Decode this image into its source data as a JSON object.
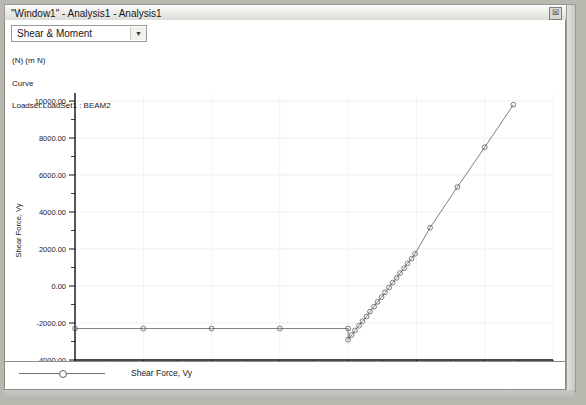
{
  "window": {
    "title": "\"Window1\" - Analysis1 - Analysis1",
    "close_icon": "close-icon",
    "close_glyph": "☒"
  },
  "toolbar": {
    "combo_value": "Shear & Moment",
    "combo_arrow_icon": "chevron-down-icon",
    "combo_arrow_glyph": "▼"
  },
  "header_info": {
    "line1": "(N) (m N)",
    "line2": "Curve",
    "line3": "Loadset:LoadSet1 : BEAM2"
  },
  "legend": {
    "entry_label": "Shear Force, Vy"
  },
  "chart_data": {
    "type": "line",
    "title": "",
    "xlabel": "Curve Arc Length (m)",
    "ylabel": "Shear Force, Vy",
    "xlim": [
      0,
      7
    ],
    "ylim": [
      -4000,
      10000
    ],
    "xticks": [
      0,
      1,
      2,
      3,
      4,
      5,
      6,
      7
    ],
    "xticklabels": [
      "0.00",
      "1.00",
      "2.00",
      "3.00",
      "4.00",
      "5.00",
      "6.00",
      "7.00"
    ],
    "yticks": [
      -4000,
      -2000,
      0,
      2000,
      4000,
      6000,
      8000,
      10000
    ],
    "yticklabels": [
      "-4000.00",
      "-2000.00",
      "0.00",
      "2000.00",
      "4000.00",
      "6000.00",
      "8000.00",
      "10000.00"
    ],
    "x_minor_step": 0.5,
    "y_minor_step": 1000,
    "grid": true,
    "legend_position": "below-plot",
    "series": [
      {
        "name": "Shear Force, Vy",
        "color": "#6f6f78",
        "marker": "circle",
        "x": [
          0.0,
          1.0,
          2.0,
          3.0,
          4.0,
          4.0,
          4.05,
          4.1,
          4.16,
          4.21,
          4.27,
          4.32,
          4.38,
          4.43,
          4.49,
          4.54,
          4.6,
          4.65,
          4.71,
          4.76,
          4.82,
          4.87,
          4.93,
          4.98,
          5.2,
          5.6,
          6.0,
          6.42
        ],
        "y": [
          -2300,
          -2300,
          -2300,
          -2300,
          -2300,
          -2900,
          -2650,
          -2400,
          -2150,
          -1900,
          -1650,
          -1380,
          -1120,
          -860,
          -600,
          -340,
          -80,
          180,
          440,
          700,
          960,
          1220,
          1480,
          1740,
          3150,
          5350,
          7500,
          9800
        ]
      }
    ]
  }
}
